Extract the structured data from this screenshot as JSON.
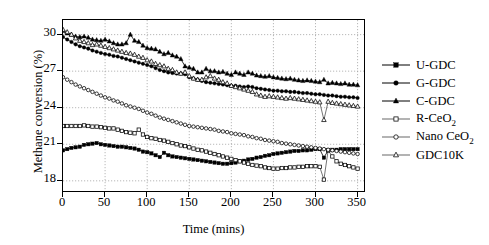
{
  "chart_data": {
    "type": "line",
    "title": "",
    "xlabel": "Time (mins)",
    "ylabel": "Methane conversion (%)",
    "xlim": [
      0,
      360
    ],
    "ylim": [
      17.0,
      31.2
    ],
    "xticks": [
      0,
      50,
      100,
      150,
      200,
      250,
      300,
      350
    ],
    "yticks": [
      18,
      21,
      24,
      27,
      30
    ],
    "grid": "dotted-both",
    "legend_position": "right-outside",
    "series": [
      {
        "name": "U-GDC",
        "marker": "filled-square",
        "x": [
          0,
          5,
          10,
          15,
          20,
          25,
          30,
          35,
          40,
          45,
          50,
          55,
          60,
          65,
          70,
          75,
          80,
          85,
          90,
          95,
          100,
          105,
          110,
          115,
          120,
          125,
          130,
          135,
          140,
          145,
          150,
          155,
          160,
          165,
          170,
          175,
          180,
          185,
          190,
          195,
          200,
          205,
          210,
          215,
          220,
          225,
          230,
          235,
          240,
          245,
          250,
          255,
          260,
          265,
          270,
          275,
          280,
          285,
          290,
          295,
          300,
          305,
          310,
          315,
          320,
          325,
          330,
          335,
          340,
          345,
          350
        ],
        "y": [
          20.5,
          20.6,
          20.7,
          20.75,
          20.8,
          20.95,
          21.0,
          21.05,
          21.1,
          21.0,
          20.95,
          20.9,
          20.85,
          20.8,
          20.8,
          20.75,
          20.7,
          20.65,
          20.55,
          20.4,
          20.35,
          20.25,
          20.1,
          19.95,
          20.3,
          20.1,
          20.0,
          19.95,
          19.9,
          19.85,
          19.8,
          19.75,
          19.7,
          19.65,
          19.6,
          19.55,
          19.5,
          19.45,
          19.4,
          19.4,
          19.45,
          19.5,
          19.6,
          19.65,
          19.75,
          19.8,
          19.9,
          19.95,
          20.05,
          20.1,
          20.2,
          20.25,
          20.3,
          20.35,
          20.4,
          20.45,
          20.45,
          20.5,
          20.5,
          20.55,
          20.6,
          20.6,
          19.9,
          20.5,
          20.55,
          20.55,
          20.6,
          20.6,
          20.6,
          20.6,
          20.6
        ]
      },
      {
        "name": "G-GDC",
        "marker": "filled-circle",
        "x": [
          0,
          5,
          10,
          15,
          20,
          25,
          30,
          35,
          40,
          45,
          50,
          55,
          60,
          65,
          70,
          75,
          80,
          85,
          90,
          95,
          100,
          105,
          110,
          115,
          120,
          125,
          130,
          135,
          140,
          145,
          150,
          155,
          160,
          165,
          170,
          175,
          180,
          185,
          190,
          195,
          200,
          205,
          210,
          215,
          220,
          225,
          230,
          235,
          240,
          245,
          250,
          255,
          260,
          265,
          270,
          275,
          280,
          285,
          290,
          295,
          300,
          305,
          310,
          315,
          320,
          325,
          330,
          335,
          340,
          345,
          350
        ],
        "y": [
          29.8,
          29.6,
          29.4,
          29.2,
          29.05,
          28.95,
          28.85,
          28.7,
          28.6,
          28.5,
          28.4,
          28.35,
          28.25,
          28.2,
          28.1,
          28.0,
          27.9,
          27.8,
          27.7,
          27.6,
          27.5,
          27.4,
          27.25,
          27.1,
          27.0,
          26.9,
          26.85,
          26.8,
          26.8,
          26.75,
          26.5,
          26.4,
          26.3,
          26.2,
          26.1,
          26.05,
          26.0,
          25.95,
          25.9,
          25.85,
          25.8,
          25.8,
          25.75,
          25.7,
          25.75,
          25.7,
          25.6,
          25.55,
          25.5,
          25.45,
          25.4,
          25.4,
          25.35,
          25.35,
          25.3,
          25.3,
          25.25,
          25.2,
          25.2,
          25.15,
          25.1,
          25.1,
          25.05,
          25.0,
          25.0,
          24.95,
          24.9,
          24.9,
          24.85,
          24.85,
          24.8
        ]
      },
      {
        "name": "C-GDC",
        "marker": "filled-triangle",
        "x": [
          0,
          5,
          10,
          15,
          20,
          25,
          30,
          35,
          40,
          45,
          50,
          55,
          60,
          65,
          70,
          75,
          80,
          85,
          90,
          95,
          100,
          105,
          110,
          115,
          120,
          125,
          130,
          135,
          140,
          145,
          150,
          155,
          160,
          165,
          170,
          175,
          180,
          185,
          190,
          195,
          200,
          205,
          210,
          215,
          220,
          225,
          230,
          235,
          240,
          245,
          250,
          255,
          260,
          265,
          270,
          275,
          280,
          285,
          290,
          295,
          300,
          305,
          310,
          315,
          320,
          325,
          330,
          335,
          340,
          345,
          350
        ],
        "y": [
          30.3,
          30.1,
          30.0,
          29.85,
          29.8,
          29.85,
          29.75,
          29.6,
          29.55,
          29.5,
          29.6,
          29.45,
          29.3,
          29.2,
          29.2,
          29.3,
          30.0,
          29.5,
          29.4,
          29.1,
          28.9,
          28.85,
          28.8,
          28.6,
          28.4,
          28.5,
          28.3,
          28.2,
          28.0,
          27.4,
          27.3,
          27.2,
          26.9,
          26.9,
          27.2,
          27.0,
          27.0,
          26.9,
          26.95,
          26.8,
          26.7,
          26.9,
          26.8,
          26.7,
          26.9,
          26.8,
          26.65,
          26.6,
          26.55,
          26.6,
          26.5,
          26.45,
          26.4,
          26.35,
          26.4,
          26.3,
          26.25,
          26.2,
          26.25,
          26.2,
          26.15,
          26.1,
          26.3,
          26.0,
          26.05,
          26.0,
          25.95,
          26.0,
          25.9,
          25.9,
          25.85
        ]
      },
      {
        "name": "R-CeO2",
        "marker": "open-square",
        "x": [
          0,
          5,
          10,
          15,
          20,
          25,
          30,
          35,
          40,
          45,
          50,
          55,
          60,
          65,
          70,
          75,
          80,
          85,
          90,
          95,
          100,
          105,
          110,
          115,
          120,
          125,
          130,
          135,
          140,
          145,
          150,
          155,
          160,
          165,
          170,
          175,
          180,
          185,
          190,
          195,
          200,
          205,
          210,
          215,
          220,
          225,
          230,
          235,
          240,
          245,
          250,
          255,
          260,
          265,
          270,
          275,
          280,
          285,
          290,
          295,
          300,
          305,
          310,
          315,
          320,
          325,
          330,
          335,
          340,
          345,
          350
        ],
        "y": [
          22.5,
          22.5,
          22.5,
          22.5,
          22.5,
          22.55,
          22.5,
          22.45,
          22.45,
          22.4,
          22.35,
          22.3,
          22.3,
          22.2,
          22.1,
          22.0,
          21.95,
          21.9,
          22.2,
          21.8,
          21.6,
          21.5,
          21.45,
          21.35,
          21.3,
          21.2,
          21.1,
          21.0,
          20.9,
          20.85,
          20.75,
          20.65,
          20.55,
          20.5,
          20.4,
          20.3,
          20.2,
          20.1,
          20.0,
          19.9,
          19.8,
          19.7,
          19.6,
          19.5,
          19.4,
          19.3,
          19.25,
          19.2,
          19.1,
          19.05,
          19.0,
          19.0,
          19.05,
          19.05,
          19.1,
          19.1,
          19.15,
          19.15,
          19.2,
          19.2,
          19.2,
          19.15,
          18.1,
          20.5,
          20.0,
          19.6,
          19.4,
          19.3,
          19.2,
          19.1,
          19.0
        ]
      },
      {
        "name": "Nano CeO2",
        "marker": "open-circle",
        "x": [
          0,
          5,
          10,
          15,
          20,
          25,
          30,
          35,
          40,
          45,
          50,
          55,
          60,
          65,
          70,
          75,
          80,
          85,
          90,
          95,
          100,
          105,
          110,
          115,
          120,
          125,
          130,
          135,
          140,
          145,
          150,
          155,
          160,
          165,
          170,
          175,
          180,
          185,
          190,
          195,
          200,
          205,
          210,
          215,
          220,
          225,
          230,
          235,
          240,
          245,
          250,
          255,
          260,
          265,
          270,
          275,
          280,
          285,
          290,
          295,
          300,
          305,
          310,
          315,
          320,
          325,
          330,
          335,
          340,
          345,
          350
        ],
        "y": [
          26.5,
          26.3,
          26.1,
          25.9,
          25.75,
          25.6,
          25.45,
          25.3,
          25.15,
          25.0,
          24.85,
          24.75,
          24.6,
          24.5,
          24.35,
          24.2,
          24.1,
          24.0,
          23.9,
          23.75,
          23.6,
          23.5,
          23.35,
          23.2,
          23.1,
          23.0,
          22.9,
          22.8,
          22.7,
          22.6,
          22.5,
          22.45,
          22.4,
          22.35,
          22.3,
          22.25,
          22.2,
          22.1,
          22.05,
          22.0,
          21.9,
          21.85,
          21.8,
          21.75,
          21.65,
          21.6,
          21.5,
          21.45,
          21.35,
          21.3,
          21.25,
          21.2,
          21.1,
          21.05,
          21.0,
          20.95,
          20.9,
          20.85,
          20.8,
          20.75,
          20.7,
          20.65,
          20.6,
          20.55,
          20.5,
          20.45,
          20.4,
          20.35,
          20.3,
          20.25,
          20.2
        ]
      },
      {
        "name": "GDC10K",
        "marker": "open-triangle",
        "x": [
          0,
          5,
          10,
          15,
          20,
          25,
          30,
          35,
          40,
          45,
          50,
          55,
          60,
          65,
          70,
          75,
          80,
          85,
          90,
          95,
          100,
          105,
          110,
          115,
          120,
          125,
          130,
          135,
          140,
          145,
          150,
          155,
          160,
          165,
          170,
          175,
          180,
          185,
          190,
          195,
          200,
          205,
          210,
          215,
          220,
          225,
          230,
          235,
          240,
          245,
          250,
          255,
          260,
          265,
          270,
          275,
          280,
          285,
          290,
          295,
          300,
          305,
          310,
          315,
          320,
          325,
          330,
          335,
          340,
          345,
          350
        ],
        "y": [
          30.4,
          30.2,
          30.0,
          29.7,
          29.5,
          29.4,
          29.3,
          29.15,
          29.2,
          29.1,
          29.0,
          28.9,
          28.8,
          28.7,
          28.6,
          28.5,
          28.45,
          28.35,
          28.2,
          28.1,
          27.9,
          27.8,
          27.6,
          27.5,
          27.4,
          27.2,
          27.1,
          26.9,
          26.8,
          26.9,
          26.6,
          26.4,
          26.3,
          26.3,
          26.5,
          26.6,
          26.4,
          26.3,
          26.1,
          26.0,
          25.8,
          25.7,
          25.6,
          25.5,
          25.4,
          25.3,
          25.1,
          25.0,
          24.9,
          24.95,
          24.9,
          24.85,
          24.8,
          24.75,
          24.8,
          24.75,
          24.7,
          24.65,
          24.6,
          24.55,
          24.5,
          24.45,
          23.0,
          24.5,
          24.4,
          24.35,
          24.3,
          24.25,
          24.2,
          24.15,
          24.1
        ]
      }
    ]
  },
  "axes": {
    "y_title": "Methane conversion (%)",
    "x_title": "Time (mins)",
    "y_tick_labels": [
      "30",
      "27",
      "24",
      "21",
      "18"
    ],
    "x_tick_labels": [
      "0",
      "50",
      "100",
      "150",
      "200",
      "250",
      "300",
      "350"
    ]
  },
  "legend": {
    "items": [
      {
        "label": "U-GDC",
        "marker": "filled-square",
        "sub": ""
      },
      {
        "label": "G-GDC",
        "marker": "filled-circle",
        "sub": ""
      },
      {
        "label": "C-GDC",
        "marker": "filled-triangle",
        "sub": ""
      },
      {
        "label": "R-CeO",
        "marker": "open-square",
        "sub": "2"
      },
      {
        "label": "Nano CeO",
        "marker": "open-circle",
        "sub": "2"
      },
      {
        "label": "GDC10K",
        "marker": "open-triangle",
        "sub": ""
      }
    ]
  },
  "colors": {
    "ink": "#000000",
    "background": "#ffffff",
    "grid": "#999999"
  }
}
